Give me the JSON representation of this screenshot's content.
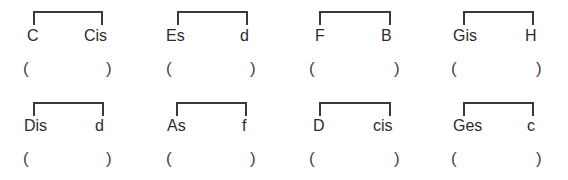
{
  "exercise": {
    "pairs": [
      {
        "left": "C",
        "right": "Cis",
        "answer_open": "(",
        "answer_close": ")"
      },
      {
        "left": "Es",
        "right": "d",
        "answer_open": "(",
        "answer_close": ")"
      },
      {
        "left": "F",
        "right": "B",
        "answer_open": "(",
        "answer_close": ")"
      },
      {
        "left": "Gis",
        "right": "H",
        "answer_open": "(",
        "answer_close": ")"
      },
      {
        "left": "Dis",
        "right": "d",
        "answer_open": "(",
        "answer_close": ")"
      },
      {
        "left": "As",
        "right": "f",
        "answer_open": "(",
        "answer_close": ")"
      },
      {
        "left": "D",
        "right": "cis",
        "answer_open": "(",
        "answer_close": ")"
      },
      {
        "left": "Ges",
        "right": "c",
        "answer_open": "(",
        "answer_close": ")"
      }
    ]
  }
}
